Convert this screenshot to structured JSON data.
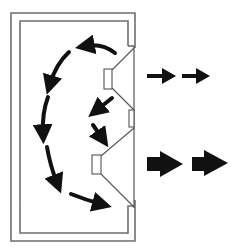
{
  "diagram": {
    "title": "Speaker enclosure sound wave diagram",
    "colors": {
      "background": "#ffffff",
      "cabinet_line": "#6e6e6e",
      "driver_line": "#555555",
      "arrow": "#111111"
    },
    "cabinet": {
      "outer": {
        "x1": 11,
        "y1": 13,
        "x2": 135,
        "y2": 241
      },
      "inner": {
        "x1": 20,
        "y1": 21,
        "x2": 128,
        "y2": 233
      }
    },
    "drivers": [
      {
        "name": "tweeter",
        "magnet": {
          "x": 104,
          "y": 69,
          "w": 8,
          "h": 20
        },
        "cone_top": 48,
        "cone_bottom": 110
      },
      {
        "name": "woofer",
        "magnet": {
          "x": 92,
          "y": 155,
          "w": 9,
          "h": 19
        },
        "cone_top": 131,
        "cone_bottom": 207
      }
    ],
    "output_arrows": [
      {
        "name": "tweeter-output",
        "size": "small",
        "count": 2
      },
      {
        "name": "woofer-output",
        "size": "large",
        "count": 2
      }
    ]
  }
}
